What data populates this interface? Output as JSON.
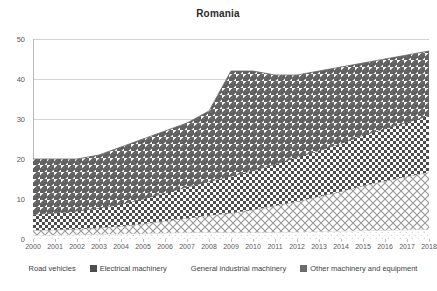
{
  "chart_data": {
    "type": "area",
    "title": "Romania",
    "xlabel": "",
    "ylabel": "",
    "ylim": [
      0,
      50
    ],
    "yticks": [
      0,
      10,
      20,
      30,
      40,
      50
    ],
    "grid": true,
    "stacked": true,
    "legend_position": "bottom",
    "categories": [
      "2000",
      "2001",
      "2002",
      "2003",
      "2004",
      "2005",
      "2006",
      "2007",
      "2008",
      "2009",
      "2010",
      "2011",
      "2012",
      "2013",
      "2014",
      "2015",
      "2016",
      "2017",
      "2018"
    ],
    "series": [
      {
        "name": "Road vehicles",
        "pattern": "light-sparse-dots",
        "values": [
          1.0,
          1.0,
          1.1,
          1.2,
          1.3,
          1.4,
          1.5,
          1.6,
          1.7,
          1.6,
          1.6,
          1.7,
          1.8,
          1.9,
          2.0,
          2.1,
          2.2,
          2.3,
          2.4
        ]
      },
      {
        "name": "General industrial machinery",
        "pattern": "diagonal-trellis",
        "values": [
          1.2,
          1.3,
          1.4,
          1.6,
          1.9,
          2.4,
          3.0,
          3.6,
          4.2,
          4.9,
          5.7,
          6.6,
          7.6,
          8.7,
          9.9,
          11.2,
          12.3,
          13.3,
          14.3
        ]
      },
      {
        "name": "Electrical machinery",
        "pattern": "checkerboard",
        "values": [
          4.0,
          4.2,
          4.5,
          4.9,
          5.5,
          6.2,
          7.0,
          7.8,
          8.5,
          9.2,
          9.8,
          10.4,
          11.0,
          11.5,
          12.0,
          12.6,
          13.1,
          13.6,
          14.1
        ]
      },
      {
        "name": "Other machinery and equipment",
        "pattern": "diagonal-stripes",
        "values": [
          13.8,
          13.5,
          13.0,
          13.3,
          14.3,
          15.0,
          15.5,
          16.0,
          17.6,
          26.3,
          24.9,
          22.3,
          20.6,
          19.9,
          19.1,
          18.1,
          17.4,
          16.8,
          16.2
        ]
      }
    ],
    "stacked_totals": [
      20.0,
      20.0,
      20.0,
      21.0,
      23.0,
      25.0,
      27.0,
      29.0,
      32.0,
      42.0,
      42.0,
      41.0,
      41.0,
      42.0,
      43.0,
      44.0,
      45.0,
      46.0,
      47.0
    ]
  },
  "legend": {
    "items": [
      {
        "label": "Road vehicles"
      },
      {
        "label": "Electrical machinery"
      },
      {
        "label": "General industrial machinery"
      },
      {
        "label": "Other machinery and equipment"
      }
    ]
  }
}
